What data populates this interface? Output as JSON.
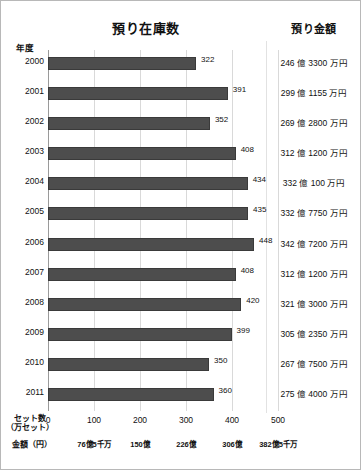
{
  "chart_data": {
    "type": "bar",
    "orientation": "horizontal",
    "title": "預り在庫数",
    "xlabel": "セット数（万セット）",
    "ylabel": "年度",
    "categories": [
      "2000",
      "2001",
      "2002",
      "2003",
      "2004",
      "2005",
      "2006",
      "2007",
      "2008",
      "2009",
      "2010",
      "2011"
    ],
    "values": [
      322,
      391,
      352,
      408,
      434,
      435,
      448,
      408,
      420,
      399,
      350,
      360
    ],
    "xlim": [
      0,
      500
    ],
    "xticks": [
      "0",
      "100",
      "200",
      "300",
      "400",
      "500"
    ],
    "xtick_values": [
      0,
      100,
      200,
      300,
      400,
      500
    ],
    "secondary_axis_label": "金額（円）",
    "secondary_xticks": [
      "",
      "76億5千万",
      "150億",
      "226億",
      "306億",
      "382億5千万"
    ],
    "grid": true,
    "legend": "none",
    "bar_color": "#4d4d4d",
    "annotation_column_title": "預り金額",
    "annotation_values": [
      "246 億 3300 万円",
      "299 億 1155 万円",
      "269 億 2800 万円",
      "312 億 1200 万円",
      "332 億 100 万円",
      "332 億 7750 万円",
      "342 億 7200 万円",
      "312 億 1200 万円",
      "321 億 3000 万円",
      "305 億 2350 万円",
      "267 億 7500 万円",
      "275 億 4000 万円"
    ]
  },
  "axis_corner_label": "年度",
  "xaxis_name_line1": "セット数",
  "xaxis_name_line2": "（万セット）",
  "money_axis_name": "金額（円）"
}
